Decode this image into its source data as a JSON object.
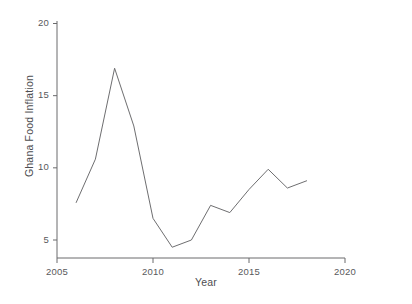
{
  "chart_data": {
    "type": "line",
    "title": "",
    "xlabel": "Year",
    "ylabel": "Ghana Food Inflation",
    "xlim": [
      2005,
      2020
    ],
    "ylim": [
      4.0,
      20.5
    ],
    "xticks": [
      2005,
      2010,
      2015,
      2020
    ],
    "yticks": [
      5,
      10,
      15,
      20
    ],
    "xtick_labels": [
      "2005",
      "2010",
      "2015",
      "2020"
    ],
    "ytick_labels": [
      "5",
      "10",
      "15",
      "20"
    ],
    "grid": false,
    "legend": null,
    "line_color": "#6e6e70",
    "series": [
      {
        "name": "Ghana Food Inflation",
        "x": [
          2006,
          2007,
          2008,
          2009,
          2010,
          2011,
          2012,
          2013,
          2014,
          2015,
          2016,
          2017,
          2018
        ],
        "values": [
          7.6,
          10.6,
          16.9,
          12.9,
          6.5,
          4.5,
          5.0,
          7.4,
          6.9,
          8.5,
          9.9,
          8.6,
          9.1
        ]
      }
    ]
  },
  "axis": {
    "x_title": "Year",
    "y_title": "Ghana Food Inflation"
  },
  "ticks": {
    "x": [
      {
        "label": "2005",
        "value": 2005
      },
      {
        "label": "2010",
        "value": 2010
      },
      {
        "label": "2015",
        "value": 2015
      },
      {
        "label": "2020",
        "value": 2020
      }
    ],
    "y": [
      {
        "label": "5",
        "value": 5
      },
      {
        "label": "10",
        "value": 10
      },
      {
        "label": "15",
        "value": 15
      },
      {
        "label": "20",
        "value": 20
      }
    ]
  }
}
